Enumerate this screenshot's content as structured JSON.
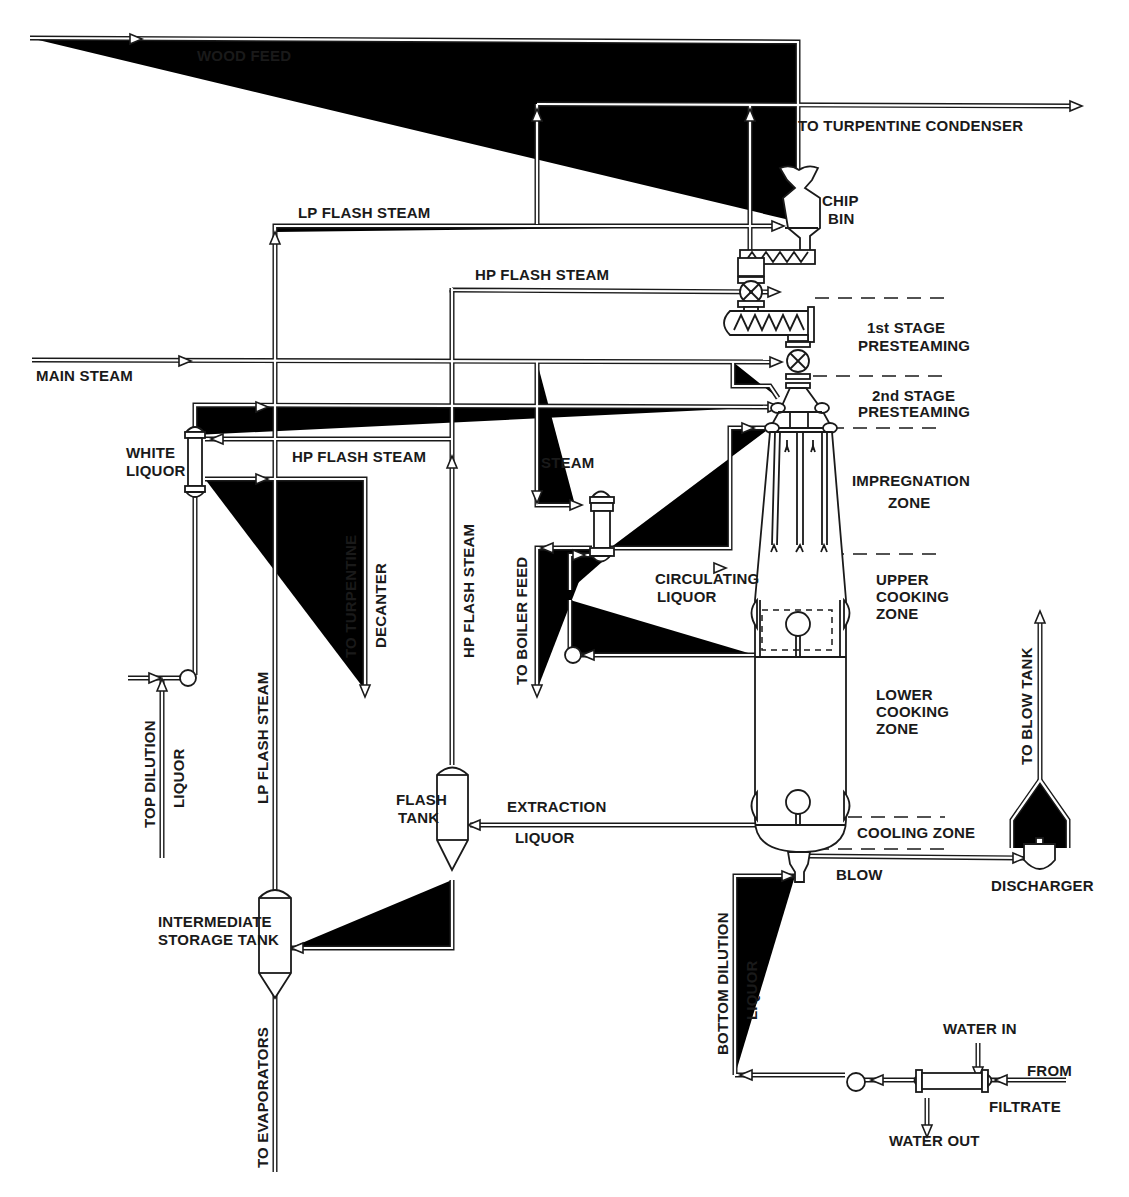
{
  "diagram": {
    "colors": {
      "ink": "#1a1a1a",
      "paper": "#ffffff"
    },
    "streams": {
      "wood_feed": "WOOD FEED",
      "to_turpentine_condenser": "TO TURPENTINE  CONDENSER",
      "lp_flash_steam_top": "LP FLASH  STEAM",
      "hp_flash_steam_top": "HP FLASH STEAM",
      "main_steam": "MAIN STEAM",
      "hp_flash_steam_mid": "HP FLASH STEAM",
      "steam": "STEAM",
      "to_turpentine": "TO TURPENTINE",
      "decanter": "DECANTER",
      "hp_flash_steam_vertical": "HP FLASH STEAM",
      "to_boiler_feed": "TO BOILER FEED",
      "circulating_liquor_1": "CIRCULATING",
      "circulating_liquor_2": "LIQUOR",
      "top_dilution": "TOP DILUTION",
      "top_dilution_liquor": "LIQUOR",
      "lp_flash_steam_vertical": "LP FLASH  STEAM",
      "extraction_1": "EXTRACTION",
      "extraction_2": "LIQUOR",
      "to_evaporators": "TO EVAPORATORS",
      "blow": "BLOW",
      "to_blow_tank": "TO BLOW TANK",
      "bottom_dilution": "BOTTOM DILUTION",
      "bottom_dilution_liquor": "LIQUOR",
      "water_in": "WATER IN",
      "water_out": "WATER OUT",
      "from": "FROM",
      "filtrate": "FILTRATE"
    },
    "equipment": {
      "chip_bin_1": "CHIP",
      "chip_bin_2": "BIN",
      "white_liquor_1": "WHITE",
      "white_liquor_2": "LIQUOR",
      "flash_tank_1": "FLASH",
      "flash_tank_2": "TANK",
      "intermediate_1": "INTERMEDIATE",
      "intermediate_2": "STORAGE TANK",
      "discharger": "DISCHARGER"
    },
    "zones": {
      "first_stage_1": "1st STAGE",
      "first_stage_2": "PRESTEAMING",
      "second_stage_1": "2nd STAGE",
      "second_stage_2": "PRESTEAMING",
      "impregnation_1": "IMPREGNATION",
      "impregnation_2": "ZONE",
      "upper_cooking_1": "UPPER",
      "upper_cooking_2": "COOKING",
      "upper_cooking_3": "ZONE",
      "lower_cooking_1": "LOWER",
      "lower_cooking_2": "COOKING",
      "lower_cooking_3": "ZONE",
      "cooling": "COOLING ZONE"
    }
  }
}
